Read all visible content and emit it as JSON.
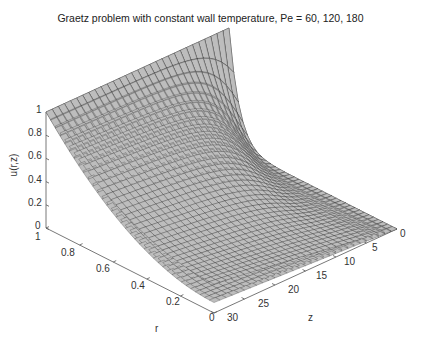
{
  "chart_data": {
    "type": "surface3d",
    "title": "Graetz problem with constant wall temperature, Pe = 60, 120, 180",
    "xlabel": "r",
    "ylabel": "z",
    "zlabel": "u(r,z)",
    "r_ticks": [
      "1",
      "0.8",
      "0.6",
      "0.4",
      "0.2",
      "0"
    ],
    "z_ticks": [
      "0",
      "5",
      "10",
      "15",
      "20",
      "25",
      "30"
    ],
    "u_ticks": [
      "0",
      "0.2",
      "0.4",
      "0.6",
      "0.8",
      "1"
    ],
    "r_range": [
      0,
      1
    ],
    "z_range": [
      0,
      30
    ],
    "u_range": [
      0,
      1
    ],
    "grid": false,
    "series": [
      {
        "name": "Pe = 60",
        "Pe": 60,
        "u_at_r0_z30": 0.25
      },
      {
        "name": "Pe = 120",
        "Pe": 120,
        "u_at_r0_z30": 0.13
      },
      {
        "name": "Pe = 180",
        "Pe": 180,
        "u_at_r0_z30": 0.09
      }
    ],
    "boundary_values": {
      "u_wall_r1": 1,
      "u_inlet_z0": 0
    },
    "surface_color": "#bdbdbd",
    "mesh_color": "#1a1a1a"
  }
}
